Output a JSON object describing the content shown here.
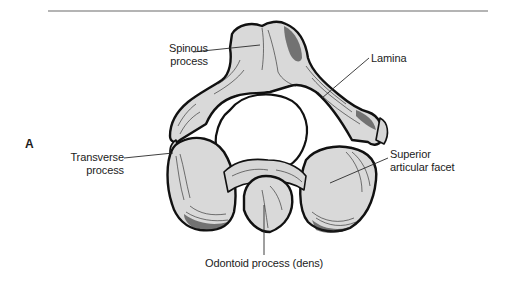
{
  "figure": {
    "panel_letter": "A",
    "colors": {
      "bone_fill": "#d9d9d9",
      "outline": "#111111",
      "rule": "#b4b4b4",
      "label_text": "#1c1c1c"
    },
    "labels": {
      "spinous_line1": "Spinous",
      "spinous_line2": "process",
      "lamina": "Lamina",
      "transverse_line1": "Transverse",
      "transverse_line2": "process",
      "superior_line1": "Superior",
      "superior_line2": "articular facet",
      "odontoid": "Odontoid process (dens)"
    }
  }
}
